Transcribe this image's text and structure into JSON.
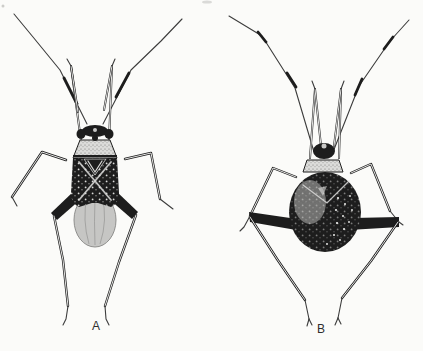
{
  "figure": {
    "panels": [
      {
        "label": "A",
        "name": "adult-plant-bug",
        "description": "winged adult bug, dorsal view"
      },
      {
        "label": "B",
        "name": "plant-bug-nymph",
        "description": "wingless nymph, dorsal view"
      }
    ]
  },
  "colors": {
    "paper": "#fbfbf9",
    "ink": "#1d1d1d",
    "ink_soft": "#3c3c3c",
    "pale": "#dcdcda",
    "membrane": "#c6c6c4",
    "membrane_edge": "#8f8f8d",
    "speck": "#efefed",
    "stipple": "#5a5a58",
    "label": "#2e2e2e",
    "smudge": "#b9b9b7"
  }
}
